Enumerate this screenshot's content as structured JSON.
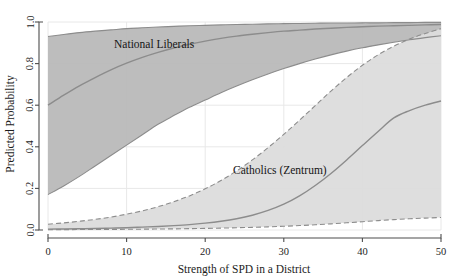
{
  "chart_data": {
    "type": "line",
    "title": "",
    "subtitle": "",
    "xlabel": "Strength of SPD in a District",
    "ylabel": "Predicted Probability",
    "xlim": [
      0,
      50
    ],
    "ylim": [
      0.0,
      1.0
    ],
    "xticks": [
      0,
      10,
      20,
      30,
      40,
      50
    ],
    "xtick_labels": [
      "0",
      "10",
      "20",
      "30",
      "40",
      "50"
    ],
    "yticks": [
      0.0,
      0.2,
      0.4,
      0.6,
      0.8,
      1.0
    ],
    "ytick_labels": [
      "0.0",
      "0.2",
      "0.4",
      "0.6",
      "0.8",
      "1.0"
    ],
    "grid": true,
    "legend_position": "inline-annotations",
    "colors": {
      "band_national_liberals": "#b9b9b9",
      "band_catholics": "#dcdcdc",
      "line": "#8c8c8c",
      "axis": "#4d4d4d",
      "grid": "#e8e8e8",
      "text": "#1c1c1c",
      "background": "#ffffff"
    },
    "x": [
      0,
      2,
      4,
      6,
      8,
      10,
      12,
      14,
      16,
      18,
      20,
      22,
      24,
      26,
      28,
      30,
      32,
      34,
      36,
      38,
      40,
      42,
      44,
      46,
      48,
      50
    ],
    "series": [
      {
        "name": "National Liberals",
        "style": "solid",
        "band_style": "solid-edge",
        "annotation": "National Liberals",
        "annotation_x": 13.5,
        "annotation_y": 0.875,
        "values": [
          0.6,
          0.648,
          0.693,
          0.733,
          0.77,
          0.802,
          0.83,
          0.854,
          0.875,
          0.893,
          0.908,
          0.921,
          0.932,
          0.941,
          0.949,
          0.956,
          0.961,
          0.966,
          0.97,
          0.974,
          0.977,
          0.98,
          0.982,
          0.984,
          0.986,
          0.988
        ],
        "lower": [
          0.17,
          0.212,
          0.258,
          0.308,
          0.358,
          0.408,
          0.458,
          0.508,
          0.55,
          0.59,
          0.625,
          0.66,
          0.692,
          0.722,
          0.75,
          0.776,
          0.8,
          0.822,
          0.842,
          0.86,
          0.876,
          0.89,
          0.903,
          0.915,
          0.925,
          0.934
        ],
        "upper": [
          0.93,
          0.94,
          0.949,
          0.956,
          0.962,
          0.968,
          0.972,
          0.976,
          0.979,
          0.982,
          0.984,
          0.986,
          0.988,
          0.989,
          0.991,
          0.992,
          0.993,
          0.994,
          0.995,
          0.995,
          0.996,
          0.996,
          0.997,
          0.997,
          0.998,
          0.998
        ]
      },
      {
        "name": "Catholics (Zentrum)",
        "style": "solid",
        "band_style": "dashed-edge",
        "annotation": "Catholics (Zentrum)",
        "annotation_x": 29.5,
        "annotation_y": 0.268,
        "values": [
          0.004,
          0.005,
          0.006,
          0.007,
          0.009,
          0.011,
          0.014,
          0.017,
          0.021,
          0.026,
          0.033,
          0.042,
          0.054,
          0.071,
          0.094,
          0.124,
          0.164,
          0.214,
          0.272,
          0.337,
          0.406,
          0.474,
          0.539,
          0.574,
          0.6,
          0.62
        ],
        "lower": [
          0.0015,
          0.0018,
          0.0021,
          0.0025,
          0.0029,
          0.0034,
          0.004,
          0.0047,
          0.0055,
          0.0065,
          0.0077,
          0.0091,
          0.0108,
          0.0128,
          0.0152,
          0.018,
          0.0213,
          0.0252,
          0.0296,
          0.0345,
          0.0398,
          0.0452,
          0.05,
          0.054,
          0.0572,
          0.06
        ],
        "upper": [
          0.028,
          0.034,
          0.042,
          0.051,
          0.062,
          0.076,
          0.092,
          0.112,
          0.136,
          0.164,
          0.198,
          0.238,
          0.284,
          0.337,
          0.396,
          0.46,
          0.528,
          0.598,
          0.668,
          0.733,
          0.792,
          0.842,
          0.884,
          0.918,
          0.945,
          0.968
        ]
      }
    ]
  },
  "axes": {
    "xlabel": "Strength of SPD in a District",
    "ylabel": "Predicted Probability"
  }
}
